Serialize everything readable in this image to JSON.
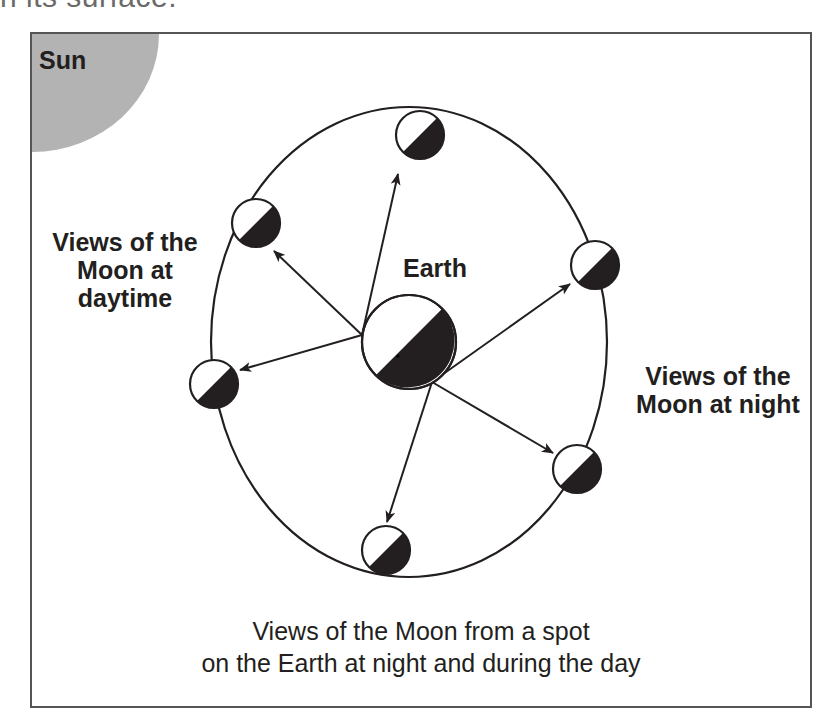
{
  "header": {
    "cropped_text": "n its surface."
  },
  "diagram": {
    "sun_label": "Sun",
    "earth_label": "Earth",
    "day_label_lines": [
      "Views of the",
      "Moon at",
      "daytime"
    ],
    "night_label_lines": [
      "Views of the",
      "Moon at night"
    ],
    "caption_lines": [
      "Views of the Moon from a spot",
      "on the Earth at night and during the day"
    ],
    "colors": {
      "sun": "#b3b3b3",
      "frame": "#555555",
      "line": "#231f20",
      "dark_side": "#231f20",
      "lit_side": "#ffffff"
    },
    "earth": {
      "cx": 377,
      "cy": 308,
      "r": 47
    },
    "orbit": {
      "cx": 377,
      "cy": 308,
      "rx": 198,
      "ry": 235
    },
    "moons": [
      {
        "name": "moon-top",
        "cx": 388,
        "cy": 101,
        "r": 24
      },
      {
        "name": "moon-upper-left",
        "cx": 224,
        "cy": 189,
        "r": 24
      },
      {
        "name": "moon-left",
        "cx": 182,
        "cy": 350,
        "r": 24
      },
      {
        "name": "moon-bottom",
        "cx": 354,
        "cy": 516,
        "r": 24
      },
      {
        "name": "moon-lower-right",
        "cx": 545,
        "cy": 435,
        "r": 24
      },
      {
        "name": "moon-upper-right",
        "cx": 563,
        "cy": 231,
        "r": 24
      }
    ],
    "arrows": [
      {
        "name": "arrow-to-top",
        "x1": 330,
        "y1": 301,
        "x2": 366,
        "y2": 140
      },
      {
        "name": "arrow-to-upper-left",
        "x1": 330,
        "y1": 301,
        "x2": 242,
        "y2": 217
      },
      {
        "name": "arrow-to-left",
        "x1": 330,
        "y1": 301,
        "x2": 208,
        "y2": 336
      },
      {
        "name": "arrow-to-upper-right",
        "x1": 400,
        "y1": 348,
        "x2": 538,
        "y2": 250
      },
      {
        "name": "arrow-to-lower-right",
        "x1": 400,
        "y1": 348,
        "x2": 521,
        "y2": 419
      },
      {
        "name": "arrow-to-bottom",
        "x1": 400,
        "y1": 348,
        "x2": 355,
        "y2": 488
      }
    ]
  }
}
